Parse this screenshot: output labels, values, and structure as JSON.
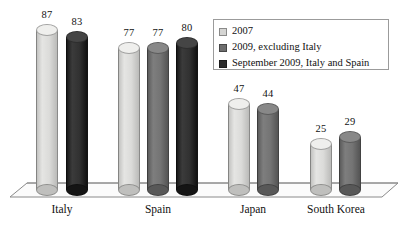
{
  "chart_data": {
    "type": "bar",
    "title": "",
    "subtitle": "",
    "xlabel": "",
    "ylabel": "",
    "ylim": [
      0,
      90
    ],
    "grid": false,
    "legend_position": "top-right",
    "categories": [
      "Italy",
      "Spain",
      "Japan",
      "South Korea"
    ],
    "series": [
      {
        "name": "2007",
        "color": "#d5d5d3",
        "values": [
          87,
          77,
          47,
          25
        ]
      },
      {
        "name": "2009, excluding Italy",
        "color": "#6e6e6e",
        "values": [
          null,
          77,
          44,
          29
        ]
      },
      {
        "name": "September 2009, Italy and Spain",
        "color": "#2b2b2b",
        "values": [
          83,
          80,
          null,
          null
        ]
      }
    ],
    "bars": [
      {
        "category": "Italy",
        "series": "2007",
        "value": 87,
        "label": "87",
        "color": "#d5d5d3",
        "x": 36,
        "w": 22
      },
      {
        "category": "Italy",
        "series": "September 2009, Italy and Spain",
        "value": 83,
        "label": "83",
        "color": "#2b2b2b",
        "x": 66,
        "w": 22
      },
      {
        "category": "Spain",
        "series": "2007",
        "value": 77,
        "label": "77",
        "color": "#d5d5d3",
        "x": 118,
        "w": 22
      },
      {
        "category": "Spain",
        "series": "2009, excluding Italy",
        "value": 77,
        "label": "77",
        "color": "#6e6e6e",
        "x": 147,
        "w": 22
      },
      {
        "category": "Spain",
        "series": "September 2009, Italy and Spain",
        "value": 80,
        "label": "80",
        "color": "#2b2b2b",
        "x": 176,
        "w": 22
      },
      {
        "category": "Japan",
        "series": "2007",
        "value": 47,
        "label": "47",
        "color": "#d5d5d3",
        "x": 228,
        "w": 22
      },
      {
        "category": "Japan",
        "series": "2009, excluding Italy",
        "value": 44,
        "label": "44",
        "color": "#6e6e6e",
        "x": 257,
        "w": 22
      },
      {
        "category": "South Korea",
        "series": "2007",
        "value": 25,
        "label": "25",
        "color": "#d5d5d3",
        "x": 310,
        "w": 22
      },
      {
        "category": "South Korea",
        "series": "2009, excluding Italy",
        "value": 29,
        "label": "29",
        "color": "#6e6e6e",
        "x": 339,
        "w": 22
      }
    ],
    "category_positions": [
      {
        "label": "Italy",
        "x": 62
      },
      {
        "label": "Spain",
        "x": 158
      },
      {
        "label": "Japan",
        "x": 253
      },
      {
        "label": "South Korea",
        "x": 336
      }
    ]
  },
  "legend": {
    "items": [
      {
        "label": "2007",
        "color": "#d5d5d3"
      },
      {
        "label": "2009, excluding Italy",
        "color": "#6e6e6e"
      },
      {
        "label": "September 2009, Italy and Spain",
        "color": "#2b2b2b"
      }
    ]
  },
  "axis": {
    "baseline_y": 190,
    "value_at_top": 87,
    "top_y": 30
  }
}
